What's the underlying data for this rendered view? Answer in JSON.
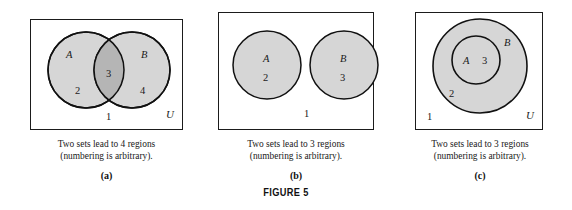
{
  "figure": {
    "label": "FIGURE 5",
    "colors": {
      "page_background": "#ffffff",
      "box_border": "#1b1b1b",
      "circle_fill": "#d6d6d6",
      "circle_overlap_fill": "#b5b5b5",
      "circle_stroke": "#111111",
      "text": "#1a1a1a"
    }
  },
  "panels": [
    {
      "key": "a",
      "letter": "(a)",
      "diagram_type": "two-overlapping-circles",
      "caption_lines": [
        "Two sets lead to 4 regions",
        "(numbering is arbitrary)."
      ],
      "universe_label": "U",
      "set_labels": [
        "A",
        "B"
      ],
      "region_numbers": [
        "1",
        "2",
        "3",
        "4"
      ],
      "labels": [
        {
          "name": "set-a-label",
          "text": "A",
          "kind": "set"
        },
        {
          "name": "set-b-label",
          "text": "B",
          "kind": "set"
        },
        {
          "name": "region-2-label",
          "text": "2",
          "kind": "num"
        },
        {
          "name": "region-3-label",
          "text": "3",
          "kind": "num"
        },
        {
          "name": "region-4-label",
          "text": "4",
          "kind": "num"
        },
        {
          "name": "region-1-label",
          "text": "1",
          "kind": "num"
        },
        {
          "name": "universe-label",
          "text": "U",
          "kind": "univ"
        }
      ]
    },
    {
      "key": "b",
      "letter": "(b)",
      "diagram_type": "two-disjoint-circles",
      "caption_lines": [
        "Two sets lead to 3 regions",
        "(numbering is arbitrary)."
      ],
      "universe_label": "",
      "set_labels": [
        "A",
        "B"
      ],
      "region_numbers": [
        "1",
        "2",
        "3"
      ],
      "labels": [
        {
          "name": "set-a-label",
          "text": "A",
          "kind": "set"
        },
        {
          "name": "region-2-label",
          "text": "2",
          "kind": "num"
        },
        {
          "name": "set-b-label",
          "text": "B",
          "kind": "set"
        },
        {
          "name": "region-3-label",
          "text": "3",
          "kind": "num"
        },
        {
          "name": "region-1-label",
          "text": "1",
          "kind": "num"
        }
      ]
    },
    {
      "key": "c",
      "letter": "(c)",
      "diagram_type": "nested-circles",
      "caption_lines": [
        "Two sets lead to 3 regions",
        "(numbering is arbitrary)."
      ],
      "universe_label": "U",
      "set_labels": [
        "A",
        "B"
      ],
      "region_numbers": [
        "1",
        "2",
        "3"
      ],
      "labels": [
        {
          "name": "set-b-label",
          "text": "B",
          "kind": "set"
        },
        {
          "name": "set-a-label",
          "text": "A",
          "kind": "set"
        },
        {
          "name": "region-3-label",
          "text": "3",
          "kind": "num"
        },
        {
          "name": "region-2-label",
          "text": "2",
          "kind": "num"
        },
        {
          "name": "region-1-label",
          "text": "1",
          "kind": "num"
        },
        {
          "name": "universe-label",
          "text": "U",
          "kind": "univ"
        }
      ]
    }
  ]
}
